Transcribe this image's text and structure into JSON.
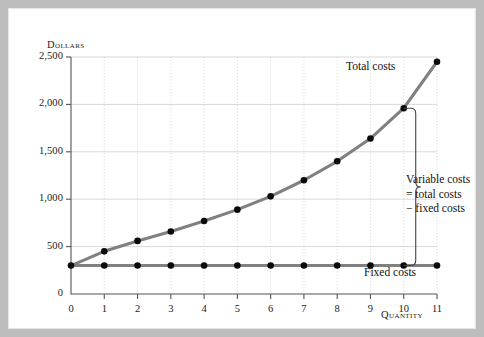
{
  "figure": {
    "background": "#ffffff",
    "frame_color": "#bdbdbd"
  },
  "chart_data": {
    "type": "line",
    "title": "",
    "xlabel": "Quantity",
    "ylabel": "Dollars",
    "xlim": [
      0,
      11
    ],
    "ylim": [
      0,
      2500
    ],
    "grid": true,
    "legend": "inline-annotations",
    "x": [
      0,
      1,
      2,
      3,
      4,
      5,
      6,
      7,
      8,
      9,
      10,
      11
    ],
    "series": [
      {
        "name": "Total costs",
        "color": "#808080",
        "marker": "filled-circle",
        "values": [
          300,
          450,
          560,
          660,
          770,
          890,
          1030,
          1200,
          1400,
          1640,
          1960,
          2450
        ]
      },
      {
        "name": "Fixed costs",
        "color": "#808080",
        "marker": "filled-circle",
        "values": [
          300,
          300,
          300,
          300,
          300,
          300,
          300,
          300,
          300,
          300,
          300,
          300
        ]
      }
    ],
    "yticks": [
      0,
      500,
      1000,
      1500,
      2000,
      2500
    ],
    "ytick_labels": [
      "0",
      "500",
      "1,000",
      "1,500",
      "2,000",
      "2,500"
    ],
    "xticks": [
      0,
      1,
      2,
      3,
      4,
      5,
      6,
      7,
      8,
      9,
      10,
      11
    ],
    "xtick_labels": [
      "0",
      "1",
      "2",
      "3",
      "4",
      "5",
      "6",
      "7",
      "8",
      "9",
      "10",
      "11"
    ],
    "annotations": [
      {
        "name": "total-costs-label",
        "text": "Total costs",
        "x": 8.3,
        "y": 2330
      },
      {
        "name": "fixed-costs-label",
        "text": "Fixed costs",
        "x": 8.8,
        "y": 210
      },
      {
        "name": "variable-costs-brace",
        "text_lines": [
          "Variable costs",
          "= total costs",
          "− fixed costs"
        ],
        "brace_x": 10,
        "brace_from": 300,
        "brace_to": 1960
      }
    ]
  },
  "axes": {
    "dollars_label": "Dollars",
    "quantity_label": "Quantity"
  },
  "annotations": {
    "total_costs": "Total costs",
    "fixed_costs": "Fixed costs",
    "variable_line1": "Variable costs",
    "variable_line2": "= total costs",
    "variable_line3": "− fixed costs"
  }
}
